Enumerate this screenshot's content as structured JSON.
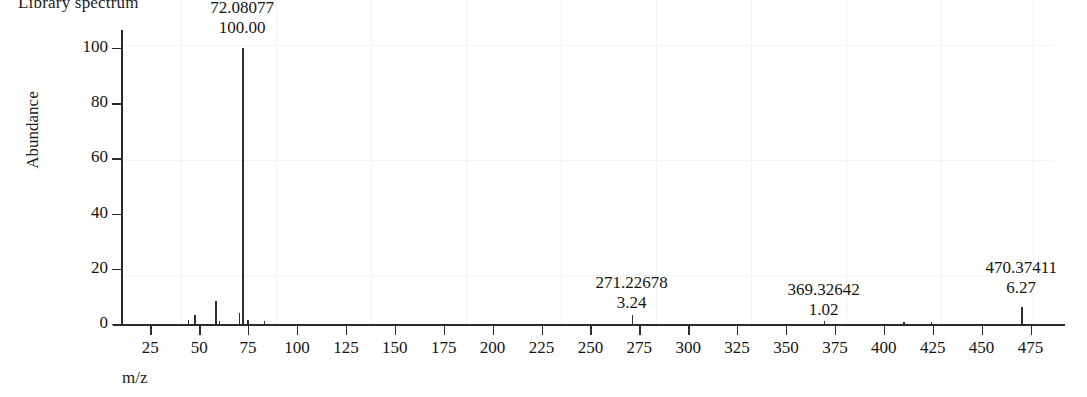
{
  "title": "Library spectrum",
  "axes": {
    "y_title": "Abundance",
    "x_title": "m/z",
    "y_ticks": [
      "0",
      "20",
      "40",
      "60",
      "80",
      "100"
    ],
    "x_ticks": [
      "25",
      "50",
      "75",
      "100",
      "125",
      "150",
      "175",
      "200",
      "225",
      "250",
      "275",
      "300",
      "325",
      "350",
      "375",
      "400",
      "425",
      "450",
      "475"
    ]
  },
  "annotations": [
    {
      "mz": "72.08077",
      "abundance": "100.00"
    },
    {
      "mz": "271.22678",
      "abundance": "3.24"
    },
    {
      "mz": "369.32642",
      "abundance": "1.02"
    },
    {
      "mz": "470.37411",
      "abundance": "6.27"
    }
  ],
  "colors": {
    "axis": "#2b2b2b",
    "peak": "#2e2e2e",
    "text": "#151515",
    "background": "#ffffff"
  },
  "chart_data": {
    "type": "bar",
    "title": "Library spectrum",
    "subtitle": "",
    "xlabel": "m/z",
    "ylabel": "Abundance",
    "xlim": [
      10,
      487
    ],
    "ylim": [
      0,
      105
    ],
    "grid": false,
    "legend": null,
    "x_tick_values": [
      25,
      50,
      75,
      100,
      125,
      150,
      175,
      200,
      225,
      250,
      275,
      300,
      325,
      350,
      375,
      400,
      425,
      450,
      475
    ],
    "y_tick_values": [
      0,
      20,
      40,
      60,
      80,
      100
    ],
    "series": [
      {
        "name": "Library spectrum",
        "x": [
          44.05,
          47.5,
          58.06,
          60.0,
          70.07,
          72.08,
          74.5,
          83.0,
          271.23,
          369.33,
          410.0,
          424.0,
          470.37
        ],
        "values": [
          1.6,
          3.4,
          8.3,
          1.0,
          4.1,
          100.0,
          1.3,
          1.1,
          3.24,
          1.02,
          0.7,
          0.8,
          6.27
        ]
      }
    ],
    "labeled_peaks": [
      {
        "mz": 72.08077,
        "abundance": 100.0
      },
      {
        "mz": 271.22678,
        "abundance": 3.24
      },
      {
        "mz": 369.32642,
        "abundance": 1.02
      },
      {
        "mz": 470.37411,
        "abundance": 6.27
      }
    ]
  }
}
